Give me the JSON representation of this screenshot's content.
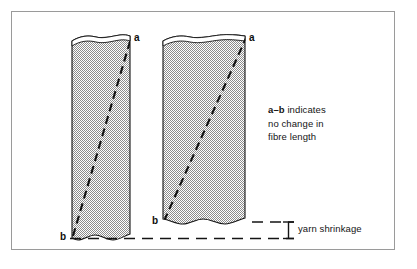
{
  "figure": {
    "background_color": "#ffffff",
    "frame_color": "#9a9a9a",
    "fabric_fill_color": "#b4b4b4",
    "line_color": "#111111"
  },
  "labels": {
    "left_top": "a",
    "left_bottom": "b",
    "right_top": "a",
    "right_bottom": "b"
  },
  "note": {
    "emphasis": "a–b",
    "line1_rest": " indicates",
    "line2": "no change in",
    "line3": "fibre length"
  },
  "dimension": {
    "label": "yarn shrinkage"
  },
  "columns": [
    {
      "name": "before-shrinkage",
      "top": 36,
      "bottom": 238,
      "left": 72,
      "right": 130
    },
    {
      "name": "after-shrinkage",
      "top": 36,
      "bottom": 222,
      "left": 163,
      "right": 245
    }
  ]
}
